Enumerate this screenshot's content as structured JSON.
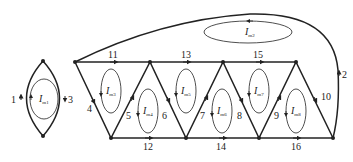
{
  "diagram": {
    "type": "circuit-graph",
    "branches": [
      {
        "id": "1",
        "label": "1"
      },
      {
        "id": "2",
        "label": "2"
      },
      {
        "id": "3",
        "label": "3"
      },
      {
        "id": "4",
        "label": "4"
      },
      {
        "id": "5",
        "label": "5"
      },
      {
        "id": "6",
        "label": "6"
      },
      {
        "id": "7",
        "label": "7"
      },
      {
        "id": "8",
        "label": "8"
      },
      {
        "id": "9",
        "label": "9"
      },
      {
        "id": "10",
        "label": "10"
      },
      {
        "id": "11",
        "label": "11"
      },
      {
        "id": "12",
        "label": "12"
      },
      {
        "id": "13",
        "label": "13"
      },
      {
        "id": "14",
        "label": "14"
      },
      {
        "id": "15",
        "label": "15"
      },
      {
        "id": "16",
        "label": "16"
      }
    ],
    "mesh_currents": [
      {
        "id": "m1",
        "label": "I",
        "sub": "m1"
      },
      {
        "id": "m2",
        "label": "I",
        "sub": "m2"
      },
      {
        "id": "m3",
        "label": "I",
        "sub": "m3"
      },
      {
        "id": "m4",
        "label": "I",
        "sub": "m4"
      },
      {
        "id": "m5",
        "label": "I",
        "sub": "m5"
      },
      {
        "id": "m6",
        "label": "I",
        "sub": "m6"
      },
      {
        "id": "m7",
        "label": "I",
        "sub": "m7"
      },
      {
        "id": "m8",
        "label": "I",
        "sub": "m8"
      }
    ]
  }
}
